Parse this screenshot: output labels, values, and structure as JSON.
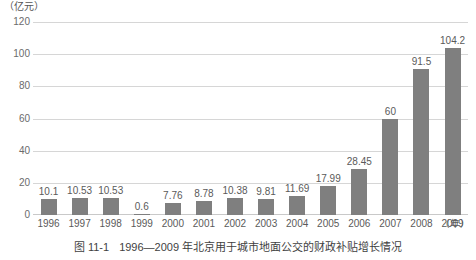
{
  "chart_data": {
    "type": "bar",
    "title": "",
    "caption_number": "图 11-1",
    "caption_text": "1996—2009 年北京用于城市地面公交的财政补贴增长情况",
    "unit_label": "（亿元）",
    "xlabel": "（年）",
    "ylabel": "",
    "categories": [
      "1996",
      "1997",
      "1998",
      "1999",
      "2000",
      "2001",
      "2002",
      "2003",
      "2004",
      "2005",
      "2006",
      "2007",
      "2008",
      "2009"
    ],
    "values": [
      10.1,
      10.53,
      10.53,
      0.6,
      7.76,
      8.78,
      10.38,
      9.81,
      11.69,
      17.99,
      28.45,
      60,
      91.5,
      104.2
    ],
    "value_labels": [
      "10.1",
      "10.53",
      "10.53",
      "0.6",
      "7.76",
      "8.78",
      "10.38",
      "9.81",
      "11.69",
      "17.99",
      "28.45",
      "60",
      "91.5",
      "104.2"
    ],
    "ylim": [
      0,
      120
    ],
    "yticks": [
      120,
      100,
      80,
      60,
      40,
      20,
      0
    ],
    "ytick_labels": [
      "120",
      "100",
      "80",
      "60",
      "40",
      "20",
      "0"
    ],
    "grid": true,
    "legend": false,
    "bar_color": "#7f7f7f",
    "grid_color": "#d6d6d6",
    "text_color": "#5a5a5a"
  }
}
